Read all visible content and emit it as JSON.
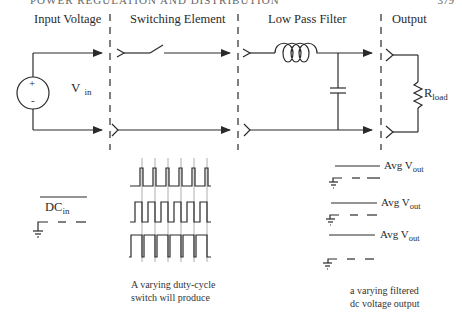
{
  "header": {
    "running_title": "POWER REGULATION AND DISTRIBUTION",
    "page_number": "379"
  },
  "sections": [
    {
      "id": "input",
      "label": "Input Voltage"
    },
    {
      "id": "switch",
      "label": "Switching Element"
    },
    {
      "id": "filter",
      "label": "Low Pass Filter"
    },
    {
      "id": "output",
      "label": "Output"
    }
  ],
  "labels": {
    "vin_main": "V",
    "vin_sub": "in",
    "source_plus": "+",
    "source_minus": "-",
    "rload_main": "R",
    "rload_sub": "load",
    "dc_main": "DC",
    "dc_sub": "in"
  },
  "avg_outputs": [
    {
      "main": "Avg V",
      "sub": "out"
    },
    {
      "main": "Avg V",
      "sub": "out"
    },
    {
      "main": "Avg V",
      "sub": "out"
    }
  ],
  "captions": {
    "switch_line1": "A varying duty-cycle",
    "switch_line2": "switch will produce",
    "output_line1": "a varying filtered",
    "output_line2": "dc voltage output"
  },
  "colors": {
    "line": "#2a2a2a",
    "grid": "#9a9a9a",
    "background": "#ffffff"
  }
}
